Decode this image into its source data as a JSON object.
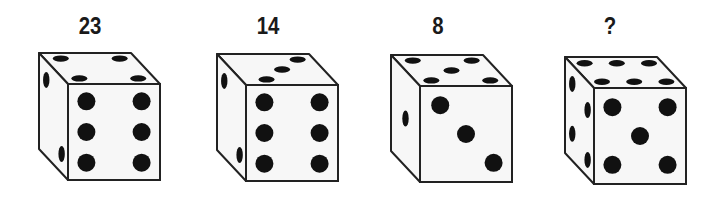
{
  "puzzle": {
    "type": "dice sequence",
    "dice": [
      {
        "label": "23",
        "top_pips": 4,
        "front_pips": 6,
        "side_pips": 2
      },
      {
        "label": "14",
        "top_pips": 3,
        "front_pips": 6,
        "side_pips": 2
      },
      {
        "label": "8",
        "top_pips": 5,
        "front_pips": 3,
        "side_pips": 1
      },
      {
        "label": "?",
        "top_pips": 6,
        "front_pips": 5,
        "side_pips": 4
      }
    ]
  },
  "colors": {
    "background": "#ffffff",
    "face": "#f7f7f7",
    "outline": "#222222",
    "pip": "#111111",
    "label": "#1a1a1a"
  }
}
